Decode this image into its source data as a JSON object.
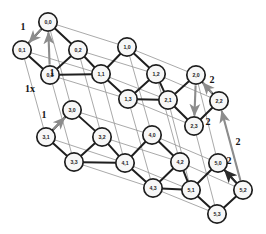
{
  "diagram": {
    "colors": {
      "node_fill": "#f7f7f7",
      "node_stroke": "#1f1f1f",
      "edge_dark": "#1f1f1f",
      "edge_gray": "#9a9a9a",
      "arrow_gray": "#8c8c8c",
      "arrow_dark": "#2b2b2b",
      "label_text": "#141414",
      "background": "#ffffff"
    },
    "node_radius": 9.2,
    "nodes": [
      {
        "id": "0-0",
        "label": "0,0",
        "x": 48,
        "y": 22
      },
      {
        "id": "0-1",
        "label": "0,1",
        "x": 22,
        "y": 50
      },
      {
        "id": "0-2",
        "label": "0,2",
        "x": 78,
        "y": 50
      },
      {
        "id": "0-3",
        "label": "0,3",
        "x": 50,
        "y": 75
      },
      {
        "id": "1-0",
        "label": "1,0",
        "x": 127,
        "y": 47
      },
      {
        "id": "1-1",
        "label": "1,1",
        "x": 101,
        "y": 74
      },
      {
        "id": "1-2",
        "label": "1,2",
        "x": 156,
        "y": 74
      },
      {
        "id": "1-3",
        "label": "1,3",
        "x": 128,
        "y": 99
      },
      {
        "id": "2-0",
        "label": "2,0",
        "x": 196,
        "y": 75
      },
      {
        "id": "2-1",
        "label": "2,1",
        "x": 168,
        "y": 100
      },
      {
        "id": "2-2",
        "label": "2,2",
        "x": 219,
        "y": 101
      },
      {
        "id": "2-3",
        "label": "2,3",
        "x": 194,
        "y": 126
      },
      {
        "id": "3-0",
        "label": "3,0",
        "x": 72,
        "y": 110
      },
      {
        "id": "3-1",
        "label": "3,1",
        "x": 46,
        "y": 137
      },
      {
        "id": "3-2",
        "label": "3,2",
        "x": 102,
        "y": 137
      },
      {
        "id": "3-3",
        "label": "3,3",
        "x": 74,
        "y": 162
      },
      {
        "id": "4-0",
        "label": "4,0",
        "x": 152,
        "y": 135
      },
      {
        "id": "4-1",
        "label": "4,1",
        "x": 125,
        "y": 163
      },
      {
        "id": "4-2",
        "label": "4,2",
        "x": 180,
        "y": 162
      },
      {
        "id": "4-3",
        "label": "4,3",
        "x": 153,
        "y": 188
      },
      {
        "id": "5-0",
        "label": "5,0",
        "x": 218,
        "y": 163
      },
      {
        "id": "5-1",
        "label": "5,1",
        "x": 191,
        "y": 190
      },
      {
        "id": "5-2",
        "label": "5,2",
        "x": 243,
        "y": 190
      },
      {
        "id": "5-3",
        "label": "5,3",
        "x": 217,
        "y": 214
      }
    ],
    "dark_edges": [
      [
        "0-0",
        "0-1"
      ],
      [
        "0-0",
        "0-2"
      ],
      [
        "0-1",
        "0-3"
      ],
      [
        "0-2",
        "0-3"
      ],
      [
        "1-0",
        "1-1"
      ],
      [
        "1-0",
        "1-2"
      ],
      [
        "1-1",
        "1-3"
      ],
      [
        "1-2",
        "1-3"
      ],
      [
        "2-0",
        "2-1"
      ],
      [
        "2-0",
        "2-2"
      ],
      [
        "2-1",
        "2-3"
      ],
      [
        "2-2",
        "2-3"
      ],
      [
        "3-0",
        "3-1"
      ],
      [
        "3-0",
        "3-2"
      ],
      [
        "3-1",
        "3-3"
      ],
      [
        "3-2",
        "3-3"
      ],
      [
        "4-0",
        "4-1"
      ],
      [
        "4-0",
        "4-2"
      ],
      [
        "4-1",
        "4-3"
      ],
      [
        "4-2",
        "4-3"
      ],
      [
        "5-0",
        "5-1"
      ],
      [
        "5-0",
        "5-2"
      ],
      [
        "5-1",
        "5-3"
      ],
      [
        "5-2",
        "5-3"
      ],
      [
        "0-2",
        "1-1"
      ],
      [
        "1-2",
        "2-1"
      ],
      [
        "3-2",
        "4-1"
      ],
      [
        "4-2",
        "5-1"
      ],
      [
        "1-3",
        "2-1"
      ],
      [
        "4-3",
        "5-1"
      ],
      [
        "0-3",
        "1-1"
      ],
      [
        "3-3",
        "4-1"
      ]
    ],
    "gray_edges": [
      [
        "0-0",
        "1-0"
      ],
      [
        "1-0",
        "2-0"
      ],
      [
        "0-1",
        "1-1"
      ],
      [
        "1-1",
        "2-1"
      ],
      [
        "0-2",
        "1-2"
      ],
      [
        "1-2",
        "2-2"
      ],
      [
        "0-3",
        "1-3"
      ],
      [
        "1-3",
        "2-3"
      ],
      [
        "3-0",
        "4-0"
      ],
      [
        "4-0",
        "5-0"
      ],
      [
        "3-1",
        "4-1"
      ],
      [
        "4-1",
        "5-1"
      ],
      [
        "3-2",
        "4-2"
      ],
      [
        "4-2",
        "5-2"
      ],
      [
        "3-3",
        "4-3"
      ],
      [
        "4-3",
        "5-3"
      ],
      [
        "0-0",
        "3-0"
      ],
      [
        "0-1",
        "3-1"
      ],
      [
        "0-2",
        "3-2"
      ],
      [
        "0-3",
        "3-3"
      ],
      [
        "1-0",
        "4-0"
      ],
      [
        "1-1",
        "4-1"
      ],
      [
        "1-2",
        "4-2"
      ],
      [
        "1-3",
        "4-3"
      ],
      [
        "2-0",
        "5-0"
      ],
      [
        "2-1",
        "5-1"
      ],
      [
        "2-2",
        "5-2"
      ],
      [
        "2-3",
        "5-3"
      ]
    ],
    "arrows": [
      {
        "id": "arrow-a",
        "label": "1",
        "from": [
          48,
          22
        ],
        "to": [
          22,
          50
        ],
        "color": "#8c8c8c",
        "label_x": 23,
        "label_y": 26
      },
      {
        "id": "arrow-b",
        "label": "1",
        "from": [
          50,
          75
        ],
        "to": [
          48,
          22
        ],
        "color": "#8c8c8c",
        "label_x": 52,
        "label_y": 72
      },
      {
        "id": "arrow-c",
        "label": "1",
        "from": [
          46,
          137
        ],
        "to": [
          72,
          110
        ],
        "color": "#8c8c8c",
        "label_x": 44,
        "label_y": 114
      },
      {
        "id": "arrow-d",
        "label": "2",
        "from": [
          219,
          101
        ],
        "to": [
          196,
          75
        ],
        "color": "#8c8c8c",
        "label_x": 212,
        "label_y": 79
      },
      {
        "id": "arrow-e",
        "label": "2",
        "from": [
          196,
          75
        ],
        "to": [
          194,
          126
        ],
        "color": "#8c8c8c",
        "label_x": 208,
        "label_y": 121
      },
      {
        "id": "arrow-f",
        "label": "2",
        "from": [
          243,
          190
        ],
        "to": [
          219,
          101
        ],
        "color": "#8c8c8c",
        "label_x": 238,
        "label_y": 141
      },
      {
        "id": "arrow-g",
        "label": "2",
        "from": [
          243,
          190
        ],
        "to": [
          218,
          163
        ],
        "color": "#2b2b2b",
        "label_x": 229,
        "label_y": 160
      }
    ],
    "extra_labels": [
      {
        "id": "label-1x",
        "text": "1x",
        "x": 30,
        "y": 88
      }
    ]
  }
}
